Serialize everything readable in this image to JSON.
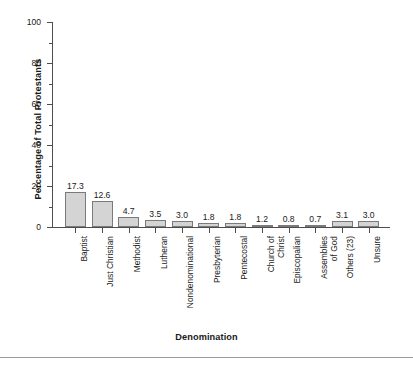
{
  "chart_data": {
    "type": "bar",
    "title": "",
    "xlabel": "Denomination",
    "ylabel": "Percentage of Total Protestants",
    "ylim": [
      0,
      100
    ],
    "yticks": [
      0,
      20,
      40,
      60,
      80,
      100
    ],
    "ytick_labels": [
      "0",
      "20",
      "40",
      "60",
      "80",
      "100"
    ],
    "yminor_interval": 10,
    "grid": false,
    "legend": null,
    "bar_fill_color": "#d4d4d4",
    "bar_edge_color": "#7a7a7a",
    "axis_color": "#4d4d4d",
    "background_color": "#ffffff",
    "categories": [
      "Baptist",
      "Just Christian",
      "Methodist",
      "Lutheran",
      "Nondenominational",
      "Presbyterian",
      "Pentecostal",
      "Church of Christ",
      "Episcopalian",
      "Assemblies of God",
      "Others (23)",
      "Unsure"
    ],
    "category_label_lines": [
      [
        "Baptist"
      ],
      [
        "Just Christian"
      ],
      [
        "Methodist"
      ],
      [
        "Lutheran"
      ],
      [
        "Nondenominational"
      ],
      [
        "Presbyterian"
      ],
      [
        "Pentecostal"
      ],
      [
        "Church of",
        "Christ"
      ],
      [
        "Episcopalian"
      ],
      [
        "Assemblies",
        "of God"
      ],
      [
        "Others (23)"
      ],
      [
        "Unsure"
      ]
    ],
    "values": [
      17.3,
      12.6,
      4.7,
      3.5,
      3.0,
      1.8,
      1.8,
      1.2,
      0.8,
      0.7,
      3.1,
      3.0
    ],
    "value_labels": [
      "17.3",
      "12.6",
      "4.7",
      "3.5",
      "3.0",
      "1.8",
      "1.8",
      "1.2",
      "0.8",
      "0.7",
      "3.1",
      "3.0"
    ]
  }
}
